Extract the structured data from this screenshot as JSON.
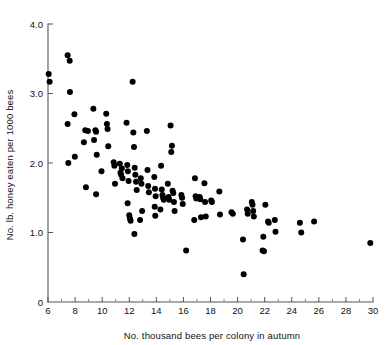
{
  "chart_data": {
    "type": "scatter",
    "title": "",
    "xlabel": "No. thousand bees per colony in autumn",
    "ylabel": "No. lb. honey eaten per 1000 bees",
    "xlim": [
      6,
      30
    ],
    "ylim": [
      0,
      4.0
    ],
    "grid": false,
    "legend": null,
    "xticks": [
      6,
      8,
      10,
      12,
      14,
      16,
      18,
      20,
      22,
      24,
      26,
      28,
      30
    ],
    "xtick_labels": [
      "6",
      "8",
      "10",
      "12",
      "14",
      "16",
      "18",
      "20",
      "22",
      "24",
      "26",
      "28",
      "30"
    ],
    "xticks_minor": [
      7,
      9,
      11,
      13,
      15,
      17,
      19,
      21,
      23,
      25,
      27,
      29
    ],
    "yticks": [
      0,
      1.0,
      2.0,
      3.0,
      4.0
    ],
    "ytick_labels": [
      "0",
      "1.0",
      "2.0",
      "3.0",
      "4.0"
    ],
    "marker": "filled-circle",
    "marker_color": "#000000",
    "marker_size_px": 3.0,
    "point_count": 115,
    "points": [
      [
        6.05,
        3.28
      ],
      [
        6.12,
        3.17
      ],
      [
        7.45,
        3.55
      ],
      [
        7.6,
        3.47
      ],
      [
        7.62,
        3.02
      ],
      [
        7.45,
        2.56
      ],
      [
        7.5,
        2.0
      ],
      [
        7.95,
        2.7
      ],
      [
        7.98,
        2.09
      ],
      [
        8.65,
        2.3
      ],
      [
        8.75,
        2.47
      ],
      [
        8.95,
        2.46
      ],
      [
        8.8,
        1.65
      ],
      [
        9.35,
        2.78
      ],
      [
        9.4,
        2.33
      ],
      [
        9.5,
        2.47
      ],
      [
        9.55,
        2.45
      ],
      [
        9.6,
        2.12
      ],
      [
        9.55,
        1.55
      ],
      [
        9.95,
        1.88
      ],
      [
        10.3,
        2.71
      ],
      [
        10.35,
        2.56
      ],
      [
        10.4,
        2.49
      ],
      [
        10.45,
        2.24
      ],
      [
        10.85,
        2.01
      ],
      [
        10.9,
        1.96
      ],
      [
        10.95,
        1.7
      ],
      [
        11.3,
        1.99
      ],
      [
        11.35,
        1.86
      ],
      [
        11.4,
        1.83
      ],
      [
        11.45,
        1.92
      ],
      [
        11.5,
        1.78
      ],
      [
        11.8,
        2.58
      ],
      [
        11.85,
        1.97
      ],
      [
        11.9,
        1.88
      ],
      [
        11.95,
        1.74
      ],
      [
        11.88,
        1.42
      ],
      [
        12.0,
        1.25
      ],
      [
        12.05,
        1.2
      ],
      [
        12.1,
        1.17
      ],
      [
        12.25,
        3.17
      ],
      [
        12.3,
        2.44
      ],
      [
        12.35,
        2.23
      ],
      [
        12.4,
        1.93
      ],
      [
        12.45,
        1.83
      ],
      [
        12.5,
        1.73
      ],
      [
        12.55,
        1.61
      ],
      [
        12.38,
        0.98
      ],
      [
        12.85,
        1.78
      ],
      [
        12.9,
        1.7
      ],
      [
        12.95,
        1.31
      ],
      [
        12.8,
        1.18
      ],
      [
        13.3,
        2.46
      ],
      [
        13.35,
        1.9
      ],
      [
        13.4,
        1.67
      ],
      [
        13.45,
        1.58
      ],
      [
        13.85,
        1.8
      ],
      [
        13.9,
        1.63
      ],
      [
        13.95,
        1.52
      ],
      [
        13.88,
        1.37
      ],
      [
        13.92,
        1.24
      ],
      [
        14.35,
        1.96
      ],
      [
        14.4,
        1.62
      ],
      [
        14.45,
        1.54
      ],
      [
        14.5,
        1.5
      ],
      [
        14.55,
        1.47
      ],
      [
        14.3,
        1.33
      ],
      [
        14.85,
        1.7
      ],
      [
        14.9,
        1.51
      ],
      [
        14.95,
        1.47
      ],
      [
        15.05,
        2.54
      ],
      [
        15.1,
        2.16
      ],
      [
        15.15,
        2.25
      ],
      [
        15.2,
        1.6
      ],
      [
        15.25,
        1.57
      ],
      [
        15.3,
        1.44
      ],
      [
        15.35,
        1.31
      ],
      [
        15.85,
        1.54
      ],
      [
        15.9,
        1.5
      ],
      [
        15.95,
        1.41
      ],
      [
        16.2,
        0.74
      ],
      [
        16.85,
        1.78
      ],
      [
        16.9,
        1.52
      ],
      [
        16.95,
        1.49
      ],
      [
        16.8,
        1.18
      ],
      [
        17.2,
        1.51
      ],
      [
        17.25,
        1.48
      ],
      [
        17.3,
        1.22
      ],
      [
        17.55,
        1.71
      ],
      [
        17.6,
        1.44
      ],
      [
        17.65,
        1.23
      ],
      [
        18.05,
        1.46
      ],
      [
        18.1,
        1.44
      ],
      [
        18.65,
        1.59
      ],
      [
        18.7,
        1.26
      ],
      [
        19.55,
        1.29
      ],
      [
        19.65,
        1.27
      ],
      [
        20.4,
        0.9
      ],
      [
        20.45,
        0.4
      ],
      [
        20.7,
        1.33
      ],
      [
        20.75,
        1.27
      ],
      [
        21.05,
        1.44
      ],
      [
        21.1,
        1.4
      ],
      [
        21.15,
        1.31
      ],
      [
        21.2,
        1.23
      ],
      [
        21.85,
        0.74
      ],
      [
        21.95,
        0.73
      ],
      [
        21.9,
        0.94
      ],
      [
        22.05,
        1.4
      ],
      [
        22.25,
        1.16
      ],
      [
        22.3,
        1.14
      ],
      [
        22.75,
        1.18
      ],
      [
        22.8,
        1.01
      ],
      [
        24.6,
        1.14
      ],
      [
        24.7,
        1.0
      ],
      [
        25.65,
        1.16
      ],
      [
        29.8,
        0.85
      ]
    ]
  }
}
